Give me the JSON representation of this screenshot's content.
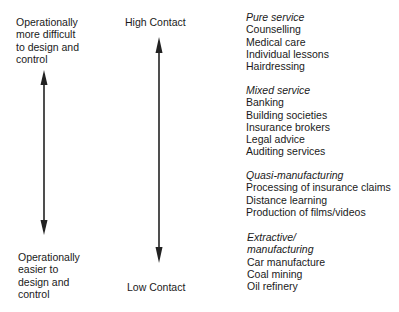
{
  "left_axis": {
    "top_label": [
      "Operationally",
      "more difficult",
      "to design and",
      "control"
    ],
    "bottom_label": [
      "Operationally",
      "easier to",
      "design and",
      "control"
    ]
  },
  "contact_axis": {
    "top_label": "High Contact",
    "bottom_label": "Low Contact"
  },
  "categories": [
    {
      "title": "Pure service",
      "items": [
        "Counselling",
        "Medical care",
        "Individual lessons",
        "Hairdressing"
      ]
    },
    {
      "title": "Mixed service",
      "items": [
        "Banking",
        "Building societies",
        "Insurance brokers",
        "Legal advice",
        "Auditing services"
      ]
    },
    {
      "title": "Quasi-manufacturing",
      "items": [
        "Processing of insurance claims",
        "Distance learning",
        "Production of films/videos"
      ]
    },
    {
      "title_lines": [
        "Extractive/",
        "manufacturing"
      ],
      "items": [
        "Car manufacture",
        "Coal mining",
        "Oil refinery"
      ]
    }
  ],
  "colors": {
    "text": "#1a1a1a",
    "arrow": "#222222",
    "background": "#ffffff"
  }
}
